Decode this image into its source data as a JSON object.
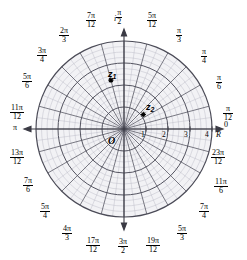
{
  "figure": {
    "origin_label": "O",
    "real_axis_label": "R",
    "imag_axis_label": "i",
    "colors": {
      "grid_minor": "#b9b9c4",
      "grid_major": "#555560",
      "spoke": "#4a4a55",
      "axis": "#3a3a44",
      "fill": "#f2f2f5",
      "text": "#000000"
    }
  },
  "chart_data": {
    "type": "scatter",
    "coordinate_system": "polar",
    "xlabel": "R",
    "ylabel": "i",
    "grid": true,
    "legend": "none",
    "radial_ticks": [
      1,
      2,
      3,
      4
    ],
    "radial_tick_labels": [
      "1",
      "2",
      "3",
      "4"
    ],
    "rlim": [
      0,
      4
    ],
    "minor_radial_divisions": 4,
    "angular_divisions": 24,
    "angle_step_label": "pi/12",
    "angle_labels": [
      {
        "value": "0",
        "deg": 0,
        "num": "",
        "den": "",
        "plain": "0"
      },
      {
        "value": "pi/12",
        "deg": 15,
        "num": "π",
        "den": "12",
        "plain": ""
      },
      {
        "value": "pi/6",
        "deg": 30,
        "num": "π",
        "den": "6",
        "plain": ""
      },
      {
        "value": "pi/4",
        "deg": 45,
        "num": "π",
        "den": "4",
        "plain": ""
      },
      {
        "value": "pi/3",
        "deg": 60,
        "num": "π",
        "den": "3",
        "plain": ""
      },
      {
        "value": "5pi/12",
        "deg": 75,
        "num": "5π",
        "den": "12",
        "plain": ""
      },
      {
        "value": "pi/2",
        "deg": 90,
        "num": "π",
        "den": "2",
        "plain": ""
      },
      {
        "value": "7pi/12",
        "deg": 105,
        "num": "7π",
        "den": "12",
        "plain": ""
      },
      {
        "value": "2pi/3",
        "deg": 120,
        "num": "2π",
        "den": "3",
        "plain": ""
      },
      {
        "value": "3pi/4",
        "deg": 135,
        "num": "3π",
        "den": "4",
        "plain": ""
      },
      {
        "value": "5pi/6",
        "deg": 150,
        "num": "5π",
        "den": "6",
        "plain": ""
      },
      {
        "value": "11pi/12",
        "deg": 165,
        "num": "11π",
        "den": "12",
        "plain": ""
      },
      {
        "value": "pi",
        "deg": 180,
        "num": "",
        "den": "",
        "plain": "π"
      },
      {
        "value": "13pi/12",
        "deg": 195,
        "num": "13π",
        "den": "12",
        "plain": ""
      },
      {
        "value": "7pi/6",
        "deg": 210,
        "num": "7π",
        "den": "6",
        "plain": ""
      },
      {
        "value": "5pi/4",
        "deg": 225,
        "num": "5π",
        "den": "4",
        "plain": ""
      },
      {
        "value": "4pi/3",
        "deg": 240,
        "num": "4π",
        "den": "3",
        "plain": ""
      },
      {
        "value": "17pi/12",
        "deg": 255,
        "num": "17π",
        "den": "12",
        "plain": ""
      },
      {
        "value": "3pi/2",
        "deg": 270,
        "num": "3π",
        "den": "2",
        "plain": ""
      },
      {
        "value": "19pi/12",
        "deg": 285,
        "num": "19π",
        "den": "12",
        "plain": ""
      },
      {
        "value": "5pi/3",
        "deg": 300,
        "num": "5π",
        "den": "3",
        "plain": ""
      },
      {
        "value": "7pi/4",
        "deg": 315,
        "num": "7π",
        "den": "4",
        "plain": ""
      },
      {
        "value": "11pi/6",
        "deg": 330,
        "num": "11π",
        "den": "6",
        "plain": ""
      },
      {
        "value": "23pi/12",
        "deg": 345,
        "num": "23π",
        "den": "12",
        "plain": ""
      }
    ],
    "points": [
      {
        "name": "z1",
        "label": "z",
        "sub": "1",
        "r": 2.3,
        "theta_deg": 105
      },
      {
        "name": "z2",
        "label": "z",
        "sub": "2",
        "r": 1.1,
        "theta_deg": 37
      }
    ]
  },
  "labels": {
    "angle_0": "0",
    "angle_pi": "π",
    "angle_pi_12_num": "π",
    "angle_pi_12_den": "12",
    "angle_pi_6_num": "π",
    "angle_pi_6_den": "6",
    "angle_pi_4_num": "π",
    "angle_pi_4_den": "4",
    "angle_pi_3_num": "π",
    "angle_pi_3_den": "3",
    "angle_5pi_12_num": "5π",
    "angle_5pi_12_den": "12",
    "angle_pi_2_num": "π",
    "angle_pi_2_den": "2",
    "angle_7pi_12_num": "7π",
    "angle_7pi_12_den": "12",
    "angle_2pi_3_num": "2π",
    "angle_2pi_3_den": "3",
    "angle_3pi_4_num": "3π",
    "angle_3pi_4_den": "4",
    "angle_5pi_6_num": "5π",
    "angle_5pi_6_den": "6",
    "angle_11pi_12_num": "11π",
    "angle_11pi_12_den": "12",
    "angle_13pi_12_num": "13π",
    "angle_13pi_12_den": "12",
    "angle_7pi_6_num": "7π",
    "angle_7pi_6_den": "6",
    "angle_5pi_4_num": "5π",
    "angle_5pi_4_den": "4",
    "angle_4pi_3_num": "4π",
    "angle_4pi_3_den": "3",
    "angle_17pi_12_num": "17π",
    "angle_17pi_12_den": "12",
    "angle_3pi_2_num": "3π",
    "angle_3pi_2_den": "2",
    "angle_19pi_12_num": "19π",
    "angle_19pi_12_den": "12",
    "angle_5pi_3_num": "5π",
    "angle_5pi_3_den": "3",
    "angle_7pi_4_num": "7π",
    "angle_7pi_4_den": "4",
    "angle_11pi_6_num": "11π",
    "angle_11pi_6_den": "6",
    "angle_23pi_12_num": "23π",
    "angle_23pi_12_den": "12",
    "tick_1": "1",
    "tick_2": "2",
    "tick_3": "3",
    "tick_4": "4",
    "origin": "O",
    "axis_R": "R",
    "axis_i": "i",
    "z1_base": "z",
    "z1_sub": "1",
    "z2_base": "z",
    "z2_sub": "2"
  }
}
